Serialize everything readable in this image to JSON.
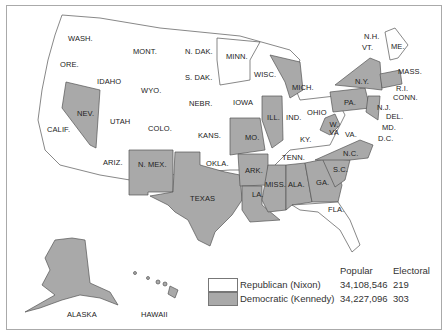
{
  "map": {
    "title": "1960 Presidential Election",
    "colors": {
      "republican": "#ffffff",
      "democratic": "#a9a9a9",
      "border": "#555555"
    },
    "states": [
      {
        "label": "WASH.",
        "party": "R"
      },
      {
        "label": "ORE.",
        "party": "R"
      },
      {
        "label": "CALIF.",
        "party": "R"
      },
      {
        "label": "IDAHO",
        "party": "R"
      },
      {
        "label": "NEV.",
        "party": "D"
      },
      {
        "label": "MONT.",
        "party": "R"
      },
      {
        "label": "WYO.",
        "party": "R"
      },
      {
        "label": "UTAH",
        "party": "R"
      },
      {
        "label": "ARIZ.",
        "party": "R"
      },
      {
        "label": "COLO.",
        "party": "R"
      },
      {
        "label": "N. MEX.",
        "party": "D"
      },
      {
        "label": "N. DAK.",
        "party": "R"
      },
      {
        "label": "S. DAK.",
        "party": "R"
      },
      {
        "label": "NEBR.",
        "party": "R"
      },
      {
        "label": "KANS.",
        "party": "R"
      },
      {
        "label": "OKLA.",
        "party": "R"
      },
      {
        "label": "TEXAS",
        "party": "D"
      },
      {
        "label": "MINN.",
        "party": "D"
      },
      {
        "label": "IOWA",
        "party": "R"
      },
      {
        "label": "MO.",
        "party": "D"
      },
      {
        "label": "ARK.",
        "party": "D"
      },
      {
        "label": "LA.",
        "party": "D"
      },
      {
        "label": "WISC.",
        "party": "R"
      },
      {
        "label": "ILL.",
        "party": "D"
      },
      {
        "label": "MICH.",
        "party": "D"
      },
      {
        "label": "IND.",
        "party": "R"
      },
      {
        "label": "OHIO",
        "party": "R"
      },
      {
        "label": "KY.",
        "party": "R"
      },
      {
        "label": "TENN.",
        "party": "R"
      },
      {
        "label": "MISS.",
        "party": "D"
      },
      {
        "label": "ALA.",
        "party": "D"
      },
      {
        "label": "GA.",
        "party": "D"
      },
      {
        "label": "FLA.",
        "party": "R"
      },
      {
        "label": "S.C.",
        "party": "D"
      },
      {
        "label": "N.C.",
        "party": "D"
      },
      {
        "label": "VA.",
        "party": "R"
      },
      {
        "label": "W. VA",
        "party": "D"
      },
      {
        "label": "PA.",
        "party": "D"
      },
      {
        "label": "N.Y.",
        "party": "D"
      },
      {
        "label": "N.J.",
        "party": "D"
      },
      {
        "label": "DEL.",
        "party": "D"
      },
      {
        "label": "MD.",
        "party": "D"
      },
      {
        "label": "D.C.",
        "party": ""
      },
      {
        "label": "CONN.",
        "party": "D"
      },
      {
        "label": "R.I.",
        "party": "D"
      },
      {
        "label": "MASS.",
        "party": "D"
      },
      {
        "label": "VT.",
        "party": "R"
      },
      {
        "label": "N.H.",
        "party": "R"
      },
      {
        "label": "ME.",
        "party": "R"
      },
      {
        "label": "ALASKA",
        "party": "D"
      },
      {
        "label": "HAWAII",
        "party": "D"
      }
    ]
  },
  "legend": {
    "col_popular": "Popular",
    "col_electoral": "Electoral",
    "rows": [
      {
        "label": "Republican (Nixon)",
        "popular": "34,108,546",
        "electoral": "219",
        "color": "#ffffff"
      },
      {
        "label": "Democratic (Kennedy)",
        "popular": "34,227,096",
        "electoral": "303",
        "color": "#a9a9a9"
      }
    ]
  }
}
